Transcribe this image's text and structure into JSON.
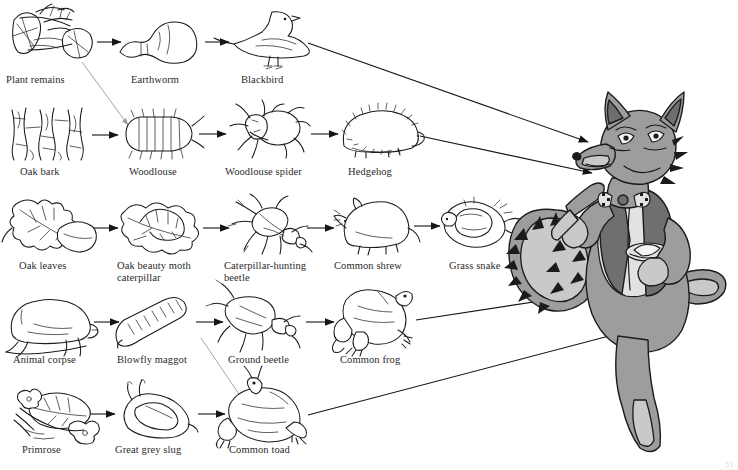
{
  "diagram": {
    "type": "food-web",
    "width": 738,
    "height": 470,
    "background_color": "#ffffff",
    "line_color": "#151515",
    "label_color": "#2a2a2a",
    "page_mark": "51"
  },
  "apex": {
    "name": "Fox",
    "label": "",
    "description": "cartoon fox standing upright wearing a waistcoat and bow tie, holding a knife and a plate",
    "colors": {
      "body": "#9d9d9d",
      "waistcoat": "#6f6f6f",
      "belly": "#e2e2e2",
      "outline": "#1b1b1b"
    }
  },
  "chains": [
    {
      "id": "chain-1",
      "nodes": [
        {
          "id": "plant-remains",
          "label": "Plant remains",
          "icon": "plant-remains-icon",
          "x": 8,
          "y": 8,
          "w": 92,
          "h": 62,
          "label_x": 6,
          "label_y": 80
        },
        {
          "id": "earthworm",
          "label": "Earthworm",
          "icon": "earthworm-icon",
          "x": 118,
          "y": 14,
          "w": 88,
          "h": 52,
          "label_x": 131,
          "label_y": 80
        },
        {
          "id": "blackbird",
          "label": "Blackbird",
          "icon": "blackbird-icon",
          "x": 228,
          "y": 8,
          "w": 88,
          "h": 62,
          "label_x": 241,
          "label_y": 80
        }
      ]
    },
    {
      "id": "chain-2",
      "nodes": [
        {
          "id": "oak-bark",
          "label": "Oak bark",
          "icon": "oak-bark-icon",
          "x": 10,
          "y": 108,
          "w": 80,
          "h": 52,
          "label_x": 20,
          "label_y": 170
        },
        {
          "id": "woodlouse",
          "label": "Woodlouse",
          "icon": "woodlouse-icon",
          "x": 120,
          "y": 112,
          "w": 76,
          "h": 46,
          "label_x": 129,
          "label_y": 170
        },
        {
          "id": "woodlouse-spider",
          "label": "Woodlouse spider",
          "icon": "woodlouse-spider-icon",
          "x": 226,
          "y": 106,
          "w": 82,
          "h": 54,
          "label_x": 225,
          "label_y": 170
        },
        {
          "id": "hedgehog",
          "label": "Hedgehog",
          "icon": "hedgehog-icon",
          "x": 338,
          "y": 110,
          "w": 86,
          "h": 48,
          "label_x": 348,
          "label_y": 170
        }
      ]
    },
    {
      "id": "chain-3",
      "nodes": [
        {
          "id": "oak-leaves",
          "label": "Oak leaves",
          "icon": "oak-leaves-icon",
          "x": 10,
          "y": 198,
          "w": 88,
          "h": 56,
          "label_x": 19,
          "label_y": 264
        },
        {
          "id": "oak-beauty-moth-caterpillar",
          "label": "Oak beauty moth\ncaterpillar",
          "icon": "caterpillar-on-leaf-icon",
          "x": 118,
          "y": 200,
          "w": 90,
          "h": 52,
          "label_x": 117,
          "label_y": 264
        },
        {
          "id": "caterpillar-hunting-beetle",
          "label": "Caterpillar-hunting\nbeetle",
          "icon": "hunting-beetle-icon",
          "x": 228,
          "y": 198,
          "w": 80,
          "h": 54,
          "label_x": 224,
          "label_y": 264
        },
        {
          "id": "common-shrew",
          "label": "Common shrew",
          "icon": "shrew-icon",
          "x": 334,
          "y": 200,
          "w": 80,
          "h": 52,
          "label_x": 334,
          "label_y": 264
        },
        {
          "id": "grass-snake",
          "label": "Grass snake",
          "icon": "grass-snake-icon",
          "x": 440,
          "y": 198,
          "w": 84,
          "h": 54,
          "label_x": 449,
          "label_y": 264
        }
      ]
    },
    {
      "id": "chain-4",
      "nodes": [
        {
          "id": "animal-corpse",
          "label": "Animal corpse",
          "icon": "animal-corpse-icon",
          "x": 8,
          "y": 298,
          "w": 86,
          "h": 52,
          "label_x": 13,
          "label_y": 358
        },
        {
          "id": "blowfly-maggot",
          "label": "Blowfly maggot",
          "icon": "blowfly-maggot-icon",
          "x": 114,
          "y": 298,
          "w": 80,
          "h": 52,
          "label_x": 117,
          "label_y": 358
        },
        {
          "id": "ground-beetle",
          "label": "Ground beetle",
          "icon": "ground-beetle-icon",
          "x": 222,
          "y": 296,
          "w": 78,
          "h": 54,
          "label_x": 228,
          "label_y": 358
        },
        {
          "id": "common-frog",
          "label": "Common frog",
          "icon": "common-frog-icon",
          "x": 338,
          "y": 292,
          "w": 80,
          "h": 58,
          "label_x": 340,
          "label_y": 358
        }
      ]
    },
    {
      "id": "chain-5",
      "nodes": [
        {
          "id": "primrose",
          "label": "Primrose",
          "icon": "primrose-icon",
          "x": 8,
          "y": 388,
          "w": 86,
          "h": 52,
          "label_x": 22,
          "label_y": 448
        },
        {
          "id": "great-grey-slug",
          "label": "Great grey slug",
          "icon": "great-grey-slug-icon",
          "x": 112,
          "y": 390,
          "w": 88,
          "h": 50,
          "label_x": 115,
          "label_y": 448
        },
        {
          "id": "common-toad",
          "label": "Common toad",
          "icon": "common-toad-icon",
          "x": 222,
          "y": 386,
          "w": 86,
          "h": 56,
          "label_x": 229,
          "label_y": 448
        }
      ]
    }
  ],
  "links": [
    {
      "id": "link-plant-earthworm",
      "from": "plant-remains",
      "to": "earthworm",
      "style": "solid-short"
    },
    {
      "id": "link-earthworm-blackbird",
      "from": "earthworm",
      "to": "blackbird",
      "style": "solid-short"
    },
    {
      "id": "link-blackbird-fox",
      "from": "blackbird",
      "to": "fox",
      "style": "solid-long"
    },
    {
      "id": "link-plant-woodlouse",
      "from": "plant-remains",
      "to": "woodlouse",
      "style": "faint-diagonal"
    },
    {
      "id": "link-oakbark-woodlouse",
      "from": "oak-bark",
      "to": "woodlouse",
      "style": "solid-short"
    },
    {
      "id": "link-woodlouse-spider",
      "from": "woodlouse",
      "to": "woodlouse-spider",
      "style": "solid-short"
    },
    {
      "id": "link-spider-hedgehog",
      "from": "woodlouse-spider",
      "to": "hedgehog",
      "style": "solid-short"
    },
    {
      "id": "link-hedgehog-fox",
      "from": "hedgehog",
      "to": "fox",
      "style": "solid-long"
    },
    {
      "id": "link-oakleaves-caterpillar",
      "from": "oak-leaves",
      "to": "oak-beauty-moth-caterpillar",
      "style": "solid-short"
    },
    {
      "id": "link-caterpillar-beetle",
      "from": "oak-beauty-moth-caterpillar",
      "to": "caterpillar-hunting-beetle",
      "style": "solid-short"
    },
    {
      "id": "link-beetle-shrew",
      "from": "caterpillar-hunting-beetle",
      "to": "common-shrew",
      "style": "solid-short"
    },
    {
      "id": "link-shrew-snake",
      "from": "common-shrew",
      "to": "grass-snake",
      "style": "solid-short"
    },
    {
      "id": "link-snake-fox",
      "from": "grass-snake",
      "to": "fox",
      "style": "solid-short"
    },
    {
      "id": "link-corpse-maggot",
      "from": "animal-corpse",
      "to": "blowfly-maggot",
      "style": "solid-short"
    },
    {
      "id": "link-maggot-groundbeetle",
      "from": "blowfly-maggot",
      "to": "ground-beetle",
      "style": "solid-short"
    },
    {
      "id": "link-groundbeetle-frog",
      "from": "ground-beetle",
      "to": "common-frog",
      "style": "solid-short"
    },
    {
      "id": "link-frog-fox",
      "from": "common-frog",
      "to": "fox",
      "style": "solid-long"
    },
    {
      "id": "link-groundbeetle-toad",
      "from": "ground-beetle",
      "to": "common-toad",
      "style": "faint-diagonal"
    },
    {
      "id": "link-primrose-slug",
      "from": "primrose",
      "to": "great-grey-slug",
      "style": "solid-short"
    },
    {
      "id": "link-slug-toad",
      "from": "great-grey-slug",
      "to": "common-toad",
      "style": "solid-short"
    },
    {
      "id": "link-toad-fox",
      "from": "common-toad",
      "to": "fox",
      "style": "solid-long"
    }
  ]
}
